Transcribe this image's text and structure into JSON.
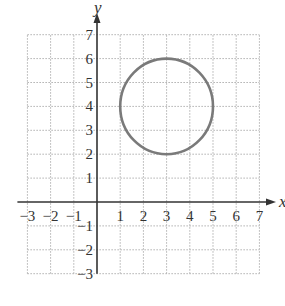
{
  "chart_data": {
    "type": "scatter",
    "title": "",
    "xlabel": "x",
    "ylabel": "y",
    "xlim": [
      -3,
      7
    ],
    "ylim": [
      -3,
      7
    ],
    "grid": true,
    "x_ticks": [
      -3,
      -2,
      -1,
      1,
      2,
      3,
      4,
      5,
      6,
      7
    ],
    "y_ticks": [
      -3,
      -2,
      -1,
      1,
      2,
      3,
      4,
      5,
      6,
      7
    ],
    "x_tick_labels": [
      "−3",
      "−2",
      "−1",
      "1",
      "2",
      "3",
      "4",
      "5",
      "6",
      "7"
    ],
    "y_tick_labels": [
      "−3",
      "−2",
      "−1",
      "1",
      "2",
      "3",
      "4",
      "5",
      "6",
      "7"
    ],
    "shapes": [
      {
        "kind": "circle",
        "center": [
          3,
          4
        ],
        "radius": 2,
        "stroke": "#7a7a7a"
      }
    ]
  },
  "colors": {
    "grid": "#b0b0b0",
    "axis": "#333333",
    "circle": "#7a7a7a"
  }
}
